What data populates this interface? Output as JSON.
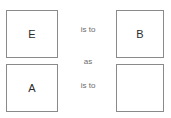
{
  "puzzle": {
    "type": "analogy",
    "grid": {
      "top_left": {
        "letter": "E",
        "empty": false
      },
      "top_right": {
        "letter": "B",
        "empty": false
      },
      "bottom_left": {
        "letter": "A",
        "empty": false
      },
      "bottom_right": {
        "letter": "",
        "empty": true
      }
    },
    "connectors": {
      "first": "is to",
      "middle": "as",
      "second": "is to"
    }
  },
  "colors": {
    "background": "#ffffff",
    "box_border": "#8a8a8a",
    "letter": "#2b2b2b",
    "connector": "#6b6b6b"
  }
}
